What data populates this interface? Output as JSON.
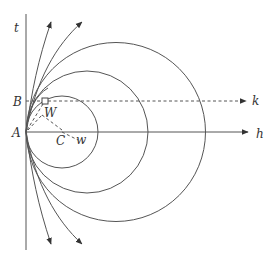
{
  "diagram": {
    "type": "geometric-construction",
    "labels": {
      "t": "t",
      "B": "B",
      "A": "A",
      "W_upper": "W",
      "C": "C",
      "w_lower": "w",
      "k": "k",
      "h": "h"
    },
    "points": {
      "A": [
        26,
        132
      ],
      "B": [
        26,
        102
      ],
      "W": [
        45,
        101
      ],
      "C": [
        62,
        132
      ],
      "w": [
        80,
        140
      ]
    },
    "circles_tangent_at_A": [
      {
        "name": "small",
        "cx": 62,
        "cy": 132,
        "r": 36
      },
      {
        "name": "medium",
        "cx": 87,
        "cy": 132,
        "r": 61
      },
      {
        "name": "large",
        "cx": 116,
        "cy": 132,
        "r": 89.5
      }
    ],
    "lines": {
      "vertical_t": {
        "x": 26,
        "y_top": 14,
        "y_bottom": 250
      },
      "horizontal_h": {
        "y": 132,
        "x_start": 26,
        "x_end": 248,
        "arrow": true
      },
      "dashed_k": {
        "y": 101,
        "x_start": 26,
        "x_end": 246,
        "arrow": true
      }
    },
    "arrows_from_A": {
      "upward_count": 2,
      "downward_count": 2
    }
  }
}
